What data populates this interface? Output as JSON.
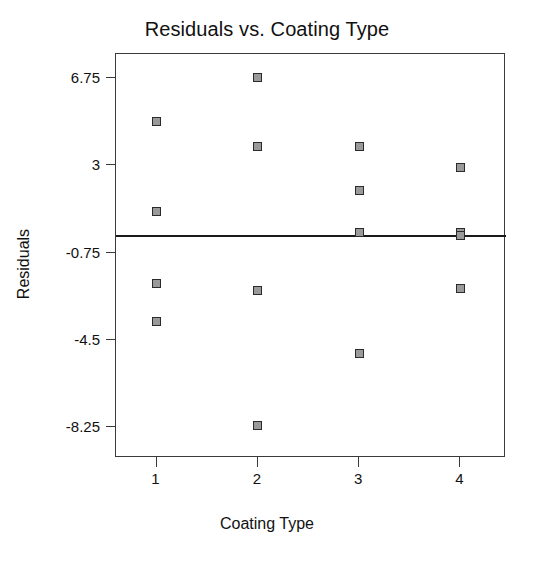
{
  "chart_data": {
    "type": "scatter",
    "title": "Residuals vs. Coating Type",
    "xlabel": "Coating Type",
    "ylabel": "Residuals",
    "grid": false,
    "legend": null,
    "xlim": [
      0.6,
      4.45
    ],
    "ylim": [
      -9.6,
      7.8
    ],
    "xticks": [
      1,
      2,
      3,
      4
    ],
    "xtick_labels": [
      "1",
      "2",
      "3",
      "4"
    ],
    "yticks": [
      6.75,
      3,
      -0.75,
      -4.5,
      -8.25
    ],
    "ytick_labels": [
      "6.75",
      "3",
      "-0.75",
      "-4.5",
      "-8.25"
    ],
    "reference_line": {
      "orientation": "horizontal",
      "y": 0
    },
    "marker": {
      "shape": "square",
      "fill": "#9a9a9a",
      "edge": "#2b2b2b",
      "size_px": 9
    },
    "points": [
      {
        "x": 1,
        "y": 4.9
      },
      {
        "x": 1,
        "y": 1.0
      },
      {
        "x": 1,
        "y": -2.1
      },
      {
        "x": 1,
        "y": -3.7
      },
      {
        "x": 2,
        "y": 6.8
      },
      {
        "x": 2,
        "y": 3.8
      },
      {
        "x": 2,
        "y": -2.4
      },
      {
        "x": 2,
        "y": -8.2
      },
      {
        "x": 3,
        "y": 3.8
      },
      {
        "x": 3,
        "y": 1.9
      },
      {
        "x": 3,
        "y": 0.1
      },
      {
        "x": 3,
        "y": -5.1
      },
      {
        "x": 4,
        "y": 2.9
      },
      {
        "x": 4,
        "y": 0.1
      },
      {
        "x": 4,
        "y": 0.0
      },
      {
        "x": 4,
        "y": -2.3
      }
    ],
    "series_by_group": [
      {
        "name": "1",
        "values": [
          4.9,
          1.0,
          -2.1,
          -3.7
        ]
      },
      {
        "name": "2",
        "values": [
          6.8,
          3.8,
          -2.4,
          -8.2
        ]
      },
      {
        "name": "3",
        "values": [
          3.8,
          1.9,
          0.1,
          -5.1
        ]
      },
      {
        "name": "4",
        "values": [
          2.9,
          0.1,
          0.0,
          -2.3
        ]
      }
    ]
  },
  "colors": {
    "background": "#ffffff",
    "frame": "#3a3a3a",
    "text": "#111111",
    "reference_line": "#1a1a1a",
    "marker_fill": "#9a9a9a",
    "marker_edge": "#2b2b2b"
  }
}
